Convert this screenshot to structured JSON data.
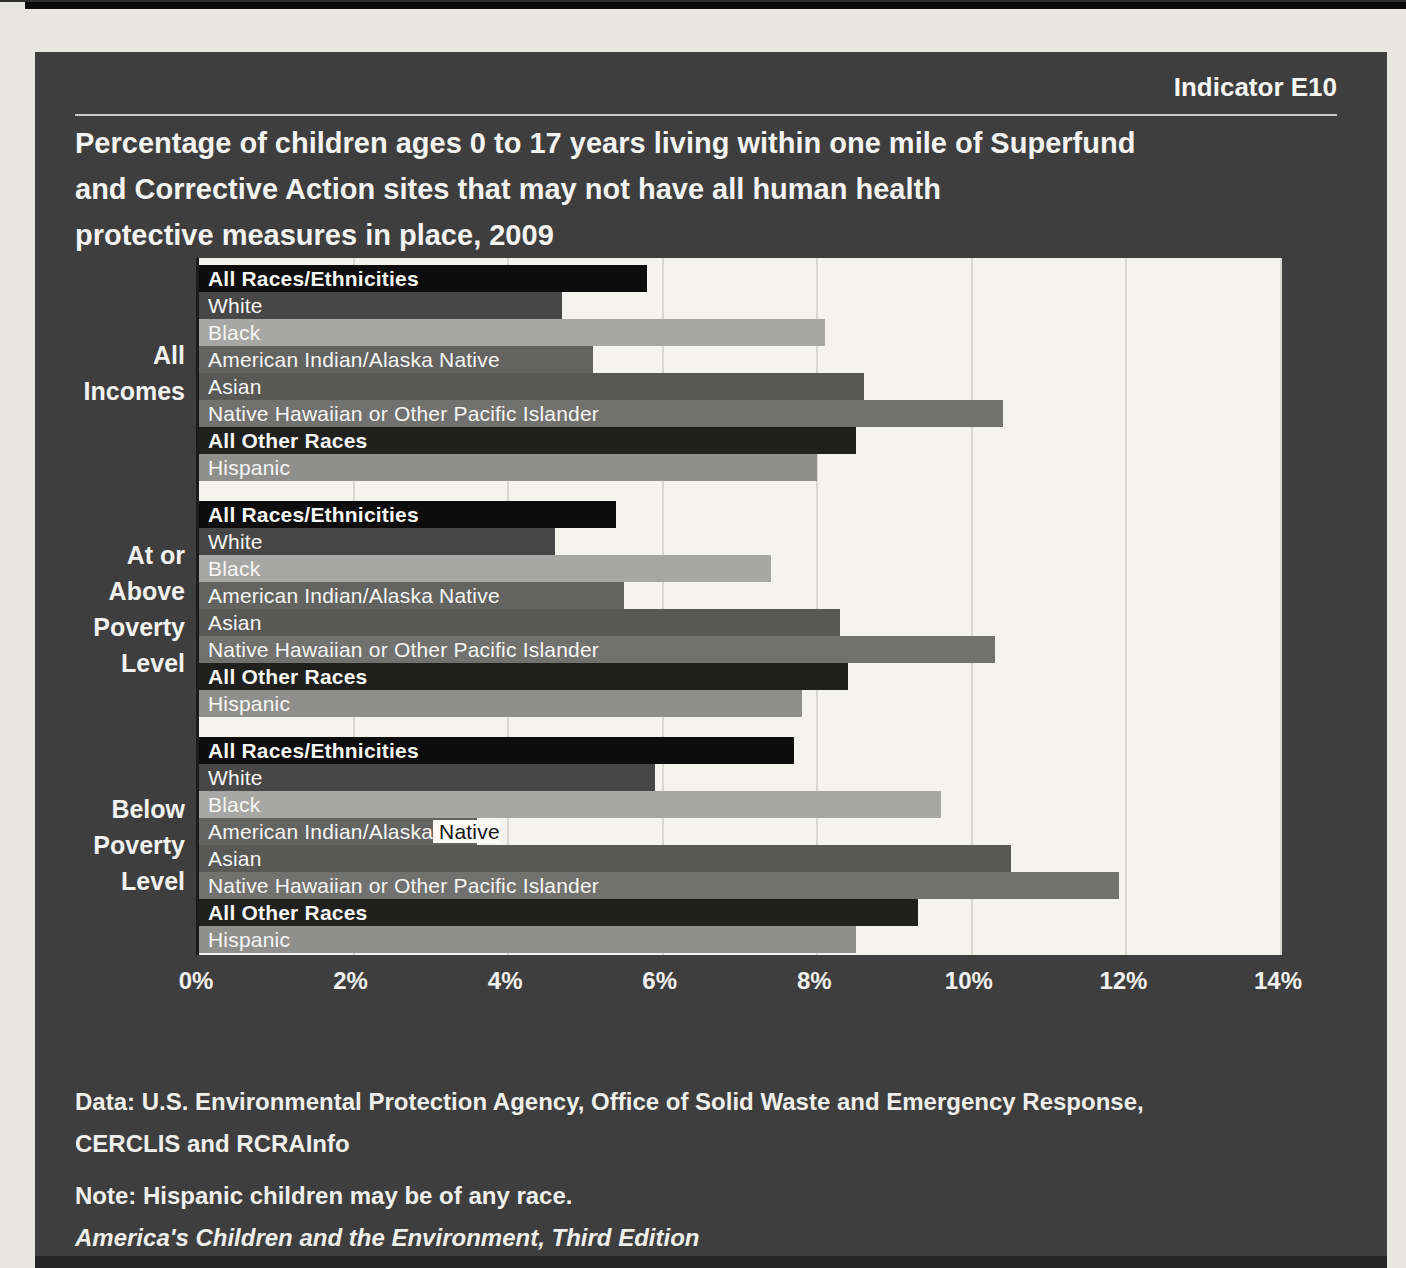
{
  "page": {
    "indicator": "Indicator E10",
    "title_lines": [
      "Percentage of children ages 0 to 17 years living within one mile of Superfund",
      "and Corrective Action sites that may not have all human health",
      "protective measures in place, 2009"
    ],
    "footer": {
      "data_source_line1": "Data: U.S. Environmental Protection Agency, Office of Solid Waste and Emergency Response,",
      "data_source_line2": "CERCLIS and RCRAInfo",
      "note": "Note: Hispanic children may be of any race.",
      "publication": "America's Children and the Environment, Third Edition"
    }
  },
  "chart_data": {
    "type": "bar",
    "orientation": "horizontal",
    "title": "Percentage of children ages 0 to 17 years living within one mile of Superfund and Corrective Action sites that may not have all human health protective measures in place, 2009",
    "unit": "percent",
    "xlim": [
      0,
      14
    ],
    "x_ticks": [
      "0%",
      "2%",
      "4%",
      "6%",
      "8%",
      "10%",
      "12%",
      "14%"
    ],
    "grid": true,
    "legend": "labels-inside-bars",
    "series": [
      {
        "name": "All Races/Ethnicities",
        "color": "#0d0d0d",
        "bold": true
      },
      {
        "name": "White",
        "color": "#474747",
        "bold": false
      },
      {
        "name": "Black",
        "color": "#a7a7a5",
        "bold": false
      },
      {
        "name": "American Indian/Alaska Native",
        "color": "#636361",
        "bold": false
      },
      {
        "name": "Asian",
        "color": "#585856",
        "bold": false
      },
      {
        "name": "Native Hawaiian or Other Pacific Islander",
        "color": "#71716f",
        "bold": false
      },
      {
        "name": "All Other Races",
        "color": "#20201f",
        "bold": true
      },
      {
        "name": "Hispanic",
        "color": "#8f8f8d",
        "bold": false
      }
    ],
    "groups": [
      {
        "label": "All Incomes",
        "label_lines": [
          "All",
          "Incomes"
        ],
        "values": [
          5.8,
          4.7,
          8.1,
          5.1,
          8.6,
          10.4,
          8.5,
          8.0
        ]
      },
      {
        "label": "At or Above Poverty Level",
        "label_lines": [
          "At or",
          "Above",
          "Poverty",
          "Level"
        ],
        "values": [
          5.4,
          4.6,
          7.4,
          5.5,
          8.3,
          10.3,
          8.4,
          7.8
        ]
      },
      {
        "label": "Below Poverty Level",
        "label_lines": [
          "Below",
          "Poverty",
          "Level"
        ],
        "values": [
          7.7,
          5.9,
          9.6,
          3.6,
          10.5,
          11.9,
          9.3,
          8.5
        ],
        "label_overrides": {
          "3": {
            "inside": "American Indian/Alaska",
            "outside": " Native"
          }
        }
      }
    ]
  }
}
